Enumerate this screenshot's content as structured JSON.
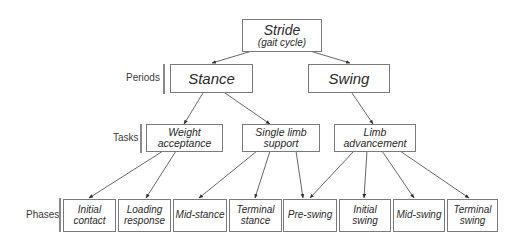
{
  "diagram": {
    "root": {
      "title": "Stride",
      "subtitle": "(gait cycle)"
    },
    "row_labels": {
      "periods": "Periods",
      "tasks": "Tasks",
      "phases": "Phases"
    },
    "periods": [
      {
        "label": "Stance"
      },
      {
        "label": "Swing"
      }
    ],
    "tasks": [
      {
        "line1": "Weight",
        "line2": "acceptance"
      },
      {
        "line1": "Single limb",
        "line2": "support"
      },
      {
        "line1": "Limb",
        "line2": "advancement"
      }
    ],
    "phases": [
      {
        "line1": "Initial",
        "line2": "contact"
      },
      {
        "line1": "Loading",
        "line2": "response"
      },
      {
        "line1": "Mid-stance",
        "line2": ""
      },
      {
        "line1": "Terminal",
        "line2": "stance"
      },
      {
        "line1": "Pre-swing",
        "line2": ""
      },
      {
        "line1": "Initial",
        "line2": "swing"
      },
      {
        "line1": "Mid-swing",
        "line2": ""
      },
      {
        "line1": "Terminal",
        "line2": "swing"
      }
    ],
    "edges": [
      [
        "Stride",
        "Stance"
      ],
      [
        "Stride",
        "Swing"
      ],
      [
        "Stance",
        "Weight acceptance"
      ],
      [
        "Stance",
        "Single limb support"
      ],
      [
        "Swing",
        "Limb advancement"
      ],
      [
        "Weight acceptance",
        "Initial contact"
      ],
      [
        "Weight acceptance",
        "Loading response"
      ],
      [
        "Single limb support",
        "Mid-stance"
      ],
      [
        "Single limb support",
        "Terminal stance"
      ],
      [
        "Single limb support",
        "Pre-swing"
      ],
      [
        "Limb advancement",
        "Pre-swing"
      ],
      [
        "Limb advancement",
        "Initial swing"
      ],
      [
        "Limb advancement",
        "Mid-swing"
      ],
      [
        "Limb advancement",
        "Terminal swing"
      ]
    ],
    "colors": {
      "line": "#555555",
      "border": "#7a7a7a",
      "text": "#2a2a2a"
    }
  }
}
